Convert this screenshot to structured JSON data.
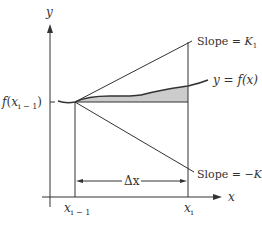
{
  "diagram": {
    "axes": {
      "y_label": "y",
      "x_label": "x"
    },
    "point_label": {
      "f": "f",
      "open": "(",
      "x": "x",
      "sub": "i − 1",
      "close": ")"
    },
    "ticks": {
      "x_prev": {
        "base": "x",
        "sub": "i − 1"
      },
      "x_curr": {
        "base": "x",
        "sub": "i"
      }
    },
    "delta_label": "Δx",
    "curve_label": "y = f(x)",
    "upper_line": {
      "prefix": "Slope = ",
      "var": "K",
      "sub": "1"
    },
    "lower_line": {
      "prefix": "Slope = −",
      "var": "K",
      "sub": "1"
    },
    "colors": {
      "line": "#333333",
      "shade": "#cccccc",
      "curve": "#333333"
    }
  }
}
